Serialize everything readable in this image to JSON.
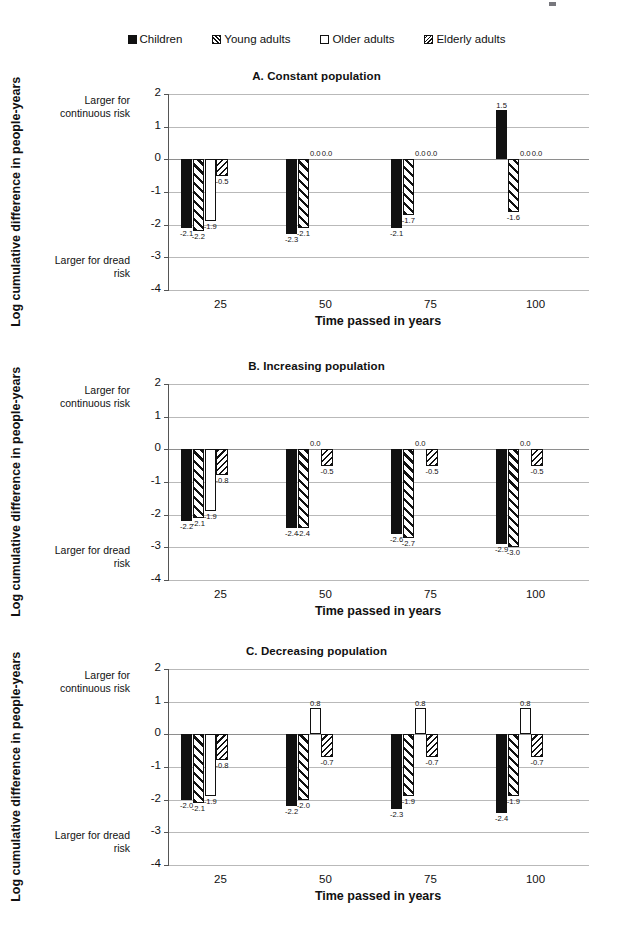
{
  "legend": {
    "items": [
      {
        "label": "Children",
        "marker": "filled-square",
        "pattern": "solid"
      },
      {
        "label": "Young adults",
        "marker": "hatched-square",
        "pattern": "hatchA"
      },
      {
        "label": "Older adults",
        "marker": "open-square",
        "pattern": "open"
      },
      {
        "label": "Elderly adults",
        "marker": "cross-hatched-square",
        "pattern": "hatchB"
      }
    ]
  },
  "axis": {
    "yticks": [
      "2",
      "1",
      "0",
      "-1",
      "-2",
      "-3",
      "-4"
    ],
    "xticks": [
      "25",
      "50",
      "75",
      "100"
    ],
    "xtitle": "Time passed in years",
    "ytitle": "Log cumulative difference in people-years",
    "note_top": "Larger for continuous risk",
    "note_bottom": "Larger for dread risk",
    "ymin": -4,
    "ymax": 2
  },
  "chart_data": [
    {
      "type": "bar",
      "title": "A. Constant population",
      "xlabel": "Time passed in years",
      "ylabel": "Log cumulative difference in people-years",
      "ylim": [
        -4,
        2
      ],
      "grid": true,
      "legend_position": "top-center",
      "categories": [
        "25",
        "50",
        "75",
        "100"
      ],
      "series": [
        {
          "name": "Children",
          "values": [
            -2.1,
            -2.3,
            -2.1,
            1.5
          ]
        },
        {
          "name": "Young adults",
          "values": [
            -2.2,
            -2.1,
            -1.7,
            -1.6
          ]
        },
        {
          "name": "Older adults",
          "values": [
            -1.9,
            0.0,
            0.0,
            0.0
          ]
        },
        {
          "name": "Elderly adults",
          "values": [
            -0.5,
            0.0,
            0.0,
            0.0
          ]
        }
      ],
      "labels": [
        [
          "-2.1",
          "-2.2",
          "-1.9",
          "-0.5"
        ],
        [
          "-2.3",
          "-2.1",
          "0.0",
          "0.0"
        ],
        [
          "-2.1",
          "-1.7",
          "0.0",
          "0.0"
        ],
        [
          "1.5",
          "-1.6",
          "0.0",
          "0.0"
        ]
      ]
    },
    {
      "type": "bar",
      "title": "B. Increasing population",
      "xlabel": "Time passed in years",
      "ylabel": "Log cumulative difference in people-years",
      "ylim": [
        -4,
        2
      ],
      "grid": true,
      "legend_position": "top-center",
      "categories": [
        "25",
        "50",
        "75",
        "100"
      ],
      "series": [
        {
          "name": "Children",
          "values": [
            -2.2,
            -2.4,
            -2.6,
            -2.9
          ]
        },
        {
          "name": "Young adults",
          "values": [
            -2.1,
            -2.4,
            -2.7,
            -3.0
          ]
        },
        {
          "name": "Older adults",
          "values": [
            -1.9,
            0.0,
            0.0,
            0.0
          ]
        },
        {
          "name": "Elderly adults",
          "values": [
            -0.8,
            -0.5,
            -0.5,
            -0.5
          ]
        }
      ],
      "labels": [
        [
          "-2.2",
          "-2.1",
          "-1.9",
          "-0.8"
        ],
        [
          "-2.4",
          "-2.4",
          "0.0",
          "-0.5"
        ],
        [
          "-2.6",
          "-2.7",
          "0.0",
          "-0.5"
        ],
        [
          "-2.9",
          "-3.0",
          "0.0",
          "-0.5"
        ]
      ]
    },
    {
      "type": "bar",
      "title": "C. Decreasing population",
      "xlabel": "Time passed in years",
      "ylabel": "Log cumulative difference in people-years",
      "ylim": [
        -4,
        2
      ],
      "grid": true,
      "legend_position": "top-center",
      "categories": [
        "25",
        "50",
        "75",
        "100"
      ],
      "series": [
        {
          "name": "Children",
          "values": [
            -2.0,
            -2.2,
            -2.3,
            -2.4
          ]
        },
        {
          "name": "Young adults",
          "values": [
            -2.1,
            -2.0,
            -1.9,
            -1.9
          ]
        },
        {
          "name": "Older adults",
          "values": [
            -1.9,
            0.8,
            0.8,
            0.8
          ]
        },
        {
          "name": "Elderly adults",
          "values": [
            -0.8,
            -0.7,
            -0.7,
            -0.7
          ]
        }
      ],
      "labels": [
        [
          "-2.0",
          "-2.1",
          "-1.9",
          "-0.8"
        ],
        [
          "-2.2",
          "-2.0",
          "0.8",
          "-0.7"
        ],
        [
          "-2.3",
          "-1.9",
          "0.8",
          "-0.7"
        ],
        [
          "-2.4",
          "-1.9",
          "0.8",
          "-0.7"
        ]
      ]
    }
  ]
}
